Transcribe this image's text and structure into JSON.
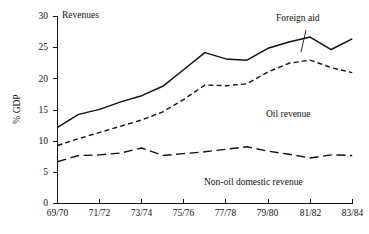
{
  "chart_data": {
    "type": "line",
    "title": "Revenues",
    "xlabel": "",
    "ylabel": "% GDP",
    "xlim": [
      0,
      14
    ],
    "ylim": [
      0,
      30
    ],
    "yticks": [
      0,
      5,
      10,
      15,
      20,
      25,
      30
    ],
    "ytick_labels": [
      "0",
      "5",
      "10",
      "15",
      "20",
      "25",
      "30"
    ],
    "grid": false,
    "legend_position": "inline-annotations",
    "x": [
      0,
      1,
      2,
      3,
      4,
      5,
      6,
      7,
      8,
      9,
      10,
      11,
      12,
      13,
      14
    ],
    "x_tick_indices": [
      0,
      2,
      4,
      6,
      8,
      10,
      12,
      14
    ],
    "categories": [
      "69/70",
      "70/71",
      "71/72",
      "72/73",
      "73/74",
      "74/75",
      "75/76",
      "76/77",
      "77/78",
      "78/79",
      "79/80",
      "80/81",
      "81/82",
      "82/83",
      "83/84"
    ],
    "xtick_labels": [
      "69/70",
      "71/72",
      "73/74",
      "75/76",
      "77/78",
      "79/80",
      "81/82",
      "83/84"
    ],
    "series": [
      {
        "name": "Foreign aid",
        "style": "solid",
        "color": "#111111",
        "values": [
          12.2,
          14.3,
          15.1,
          16.3,
          17.3,
          18.8,
          21.5,
          24.2,
          23.2,
          23.0,
          24.9,
          25.9,
          26.7,
          24.7,
          26.4
        ]
      },
      {
        "name": "Oil revenue",
        "style": "dashed",
        "color": "#111111",
        "values": [
          9.3,
          10.4,
          11.4,
          12.4,
          13.4,
          14.7,
          16.7,
          19.0,
          18.9,
          19.2,
          21.1,
          22.5,
          23.0,
          21.8,
          21.0
        ]
      },
      {
        "name": "Non-oil domestic revenue",
        "style": "longdash",
        "color": "#111111",
        "values": [
          6.7,
          7.7,
          7.8,
          8.1,
          8.9,
          7.7,
          8.0,
          8.3,
          8.7,
          9.1,
          8.4,
          7.9,
          7.3,
          7.8,
          7.7
        ]
      }
    ],
    "annotations": [
      {
        "text": "Revenues",
        "x_px": 62,
        "y_px": 10,
        "leader": false
      },
      {
        "text": "Foreign aid",
        "x_px": 276,
        "y_px": 18,
        "leader": true
      },
      {
        "text": "Oil revenue",
        "x_px": 266,
        "y_px": 113,
        "leader": false
      },
      {
        "text": "Non-oil domestic revenue",
        "x_px": 204,
        "y_px": 181,
        "leader": false
      }
    ]
  },
  "labels": {
    "chart_title": "Revenues",
    "y_axis_title": "% GDP",
    "annotation_foreign_aid": "Foreign aid",
    "annotation_oil_revenue": "Oil revenue",
    "annotation_non_oil": "Non-oil domestic revenue"
  }
}
